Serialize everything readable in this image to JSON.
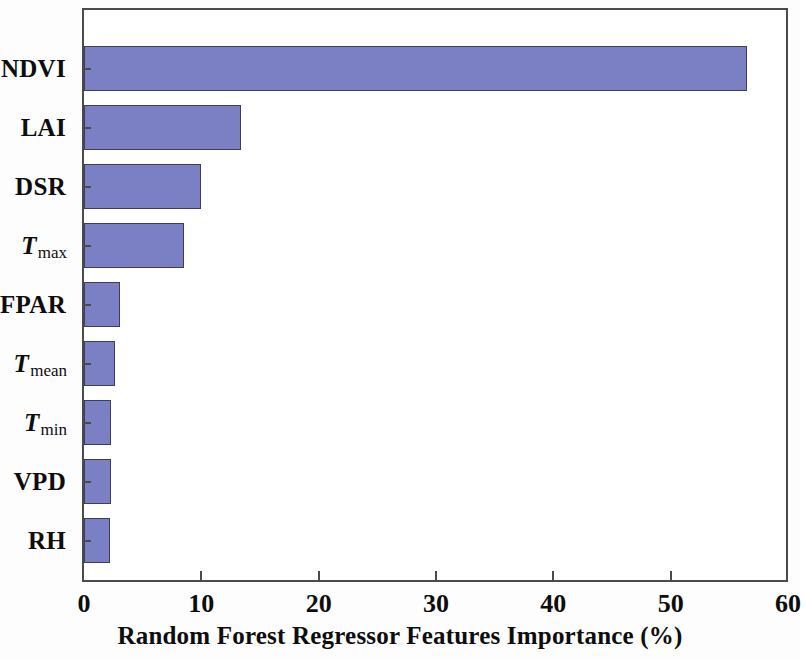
{
  "chart_data": {
    "type": "bar",
    "orientation": "horizontal",
    "title": "",
    "xlabel": "Random Forest Regressor Features Importance (%)",
    "ylabel": "",
    "xlim": [
      0,
      60
    ],
    "xticks": [
      0,
      10,
      20,
      30,
      40,
      50,
      60
    ],
    "xtick_labels": [
      "0",
      "10",
      "20",
      "30",
      "40",
      "50",
      "60"
    ],
    "grid": false,
    "legend": false,
    "bar_color": "#7b7fc4",
    "bar_edge_color": "#3d3d5c",
    "axis_color": "#4b4b4b",
    "categories": [
      "NDVI",
      "LAI",
      "DSR",
      "Tmax",
      "FPAR",
      "Tmean",
      "Tmin",
      "VPD",
      "RH"
    ],
    "category_labels": [
      {
        "text": "NDVI",
        "symbol": "",
        "subscript": ""
      },
      {
        "text": "LAI",
        "symbol": "",
        "subscript": ""
      },
      {
        "text": "DSR",
        "symbol": "",
        "subscript": ""
      },
      {
        "text": "",
        "symbol": "T",
        "subscript": "max"
      },
      {
        "text": "FPAR",
        "symbol": "",
        "subscript": ""
      },
      {
        "text": "",
        "symbol": "T",
        "subscript": "mean"
      },
      {
        "text": "",
        "symbol": "T",
        "subscript": "min"
      },
      {
        "text": "VPD",
        "symbol": "",
        "subscript": ""
      },
      {
        "text": "RH",
        "symbol": "",
        "subscript": ""
      }
    ],
    "values": [
      56.5,
      13.4,
      10.0,
      8.5,
      3.1,
      2.6,
      2.3,
      2.3,
      2.2
    ]
  }
}
